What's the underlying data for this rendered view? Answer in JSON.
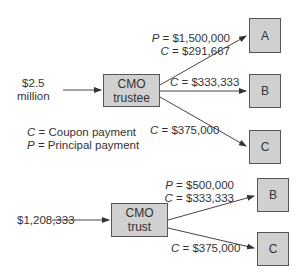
{
  "top": {
    "input": {
      "line1": "$2.5",
      "line2": "million"
    },
    "hub": {
      "line1": "CMO",
      "line2": "trustee"
    },
    "tranches": [
      {
        "name": "A",
        "principal": "$1,500,000",
        "coupon": "$291,667"
      },
      {
        "name": "B",
        "coupon": "$333,333"
      },
      {
        "name": "C",
        "coupon": "$375,000"
      }
    ],
    "legend": {
      "c_symbol": "C",
      "c_text": "= Coupon payment",
      "p_symbol": "P",
      "p_text": "= Principal payment"
    }
  },
  "bottom": {
    "input": "$1,208,333",
    "hub": {
      "line1": "CMO",
      "line2": "trust"
    },
    "tranches": [
      {
        "name": "B",
        "principal": "$500,000",
        "coupon": "$333,333"
      },
      {
        "name": "C",
        "coupon": "$375,000"
      }
    ]
  },
  "symbols": {
    "p": "P",
    "c": "C",
    "eq": " = "
  },
  "colors": {
    "box_fill": "#d0d0d0",
    "box_border": "#555555",
    "line": "#444444",
    "text": "#333333"
  }
}
